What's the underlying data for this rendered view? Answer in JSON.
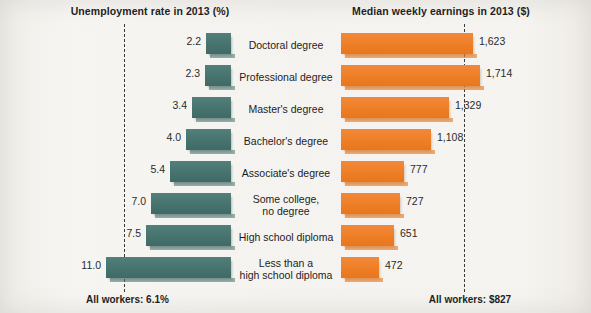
{
  "chart_data": {
    "type": "bar",
    "layout": "diverging-paired-horizontal",
    "title_left": "Unemployment rate in 2013 (%)",
    "title_right": "Median weekly earnings in 2013 ($)",
    "categories": [
      "Doctoral degree",
      "Professional degree",
      "Master's degree",
      "Bachelor's degree",
      "Associate's degree",
      "Some college,\nno degree",
      "High school diploma",
      "Less than a\nhigh school diploma"
    ],
    "series": [
      {
        "name": "Unemployment rate in 2013 (%)",
        "unit": "%",
        "direction": "left",
        "color": "#47736e",
        "values": [
          2.2,
          2.3,
          3.4,
          4.0,
          5.4,
          7.0,
          7.5,
          11.0
        ],
        "labels": [
          "2.2",
          "2.3",
          "3.4",
          "4.0",
          "5.4",
          "7.0",
          "7.5",
          "11.0"
        ],
        "axis_max": 12.4,
        "reference_line": {
          "value": 6.1,
          "label": "All workers: 6.1%"
        }
      },
      {
        "name": "Median weekly earnings in 2013 ($)",
        "unit": "$",
        "direction": "right",
        "color": "#ee7f27",
        "values": [
          1623,
          1714,
          1329,
          1108,
          777,
          727,
          651,
          472
        ],
        "labels": [
          "1,623",
          "1,714",
          "1,329",
          "1,108",
          "777",
          "727",
          "651",
          "472"
        ],
        "axis_max": 1850,
        "reference_line": {
          "value": 827,
          "label": "All workers: $827"
        }
      }
    ],
    "grid": false,
    "legend": "none",
    "xlabel": "",
    "ylabel": ""
  },
  "footer": {
    "left": "All workers: 6.1%",
    "right": "All workers: $827"
  },
  "colors": {
    "teal": "#47736e",
    "orange": "#ee7f27",
    "paper": "#f5f3ef",
    "text": "#1d1d1d"
  }
}
